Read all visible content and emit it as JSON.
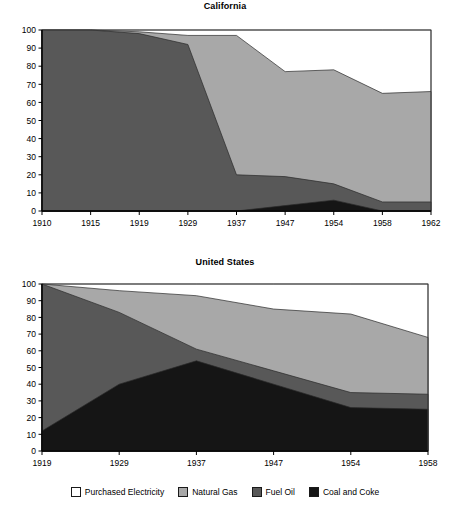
{
  "figure": {
    "legend": [
      {
        "label": "Purchased Electricity",
        "color": "#ffffff",
        "key": "purchased_electricity"
      },
      {
        "label": "Natural Gas",
        "color": "#a8a8a8",
        "key": "natural_gas"
      },
      {
        "label": "Fuel Oil",
        "color": "#585858",
        "key": "fuel_oil"
      },
      {
        "label": "Coal and Coke",
        "color": "#151515",
        "key": "coal_and_coke"
      }
    ]
  },
  "chart_data": [
    {
      "type": "area",
      "stacked": true,
      "title": "California",
      "xlabel": "",
      "ylabel": "",
      "ylim": [
        0,
        100
      ],
      "yticks": [
        0,
        10,
        20,
        30,
        40,
        50,
        60,
        70,
        80,
        90,
        100
      ],
      "grid": false,
      "legend_position": "bottom",
      "categories": [
        "1910",
        "1915",
        "1919",
        "1929",
        "1937",
        "1947",
        "1954",
        "1958",
        "1962"
      ],
      "series": [
        {
          "name": "Coal and Coke",
          "color": "#151515",
          "values": [
            0,
            0,
            0,
            0,
            0,
            3,
            6,
            0,
            0
          ]
        },
        {
          "name": "Fuel Oil",
          "color": "#585858",
          "values": [
            100,
            100,
            98,
            92,
            20,
            16,
            9,
            5,
            5
          ]
        },
        {
          "name": "Natural Gas",
          "color": "#a8a8a8",
          "values": [
            0,
            0,
            1,
            5,
            77,
            58,
            63,
            60,
            61
          ]
        },
        {
          "name": "Purchased Electricity",
          "color": "#ffffff",
          "values": [
            0,
            0,
            1,
            3,
            3,
            23,
            22,
            35,
            34
          ]
        }
      ],
      "cumulative_tops": {
        "coal_and_coke": [
          0,
          0,
          0,
          0,
          0,
          3,
          6,
          0,
          0
        ],
        "fuel_oil": [
          100,
          100,
          98,
          92,
          20,
          19,
          15,
          5,
          5
        ],
        "natural_gas": [
          100,
          100,
          99,
          97,
          97,
          77,
          78,
          65,
          66
        ],
        "purchased_electricity": [
          100,
          100,
          100,
          100,
          100,
          100,
          100,
          100,
          100
        ]
      }
    },
    {
      "type": "area",
      "stacked": true,
      "title": "United States",
      "xlabel": "",
      "ylabel": "",
      "ylim": [
        0,
        100
      ],
      "yticks": [
        0,
        10,
        20,
        30,
        40,
        50,
        60,
        70,
        80,
        90,
        100
      ],
      "grid": false,
      "legend_position": "bottom",
      "categories": [
        "1919",
        "1929",
        "1937",
        "1947",
        "1954",
        "1958"
      ],
      "series": [
        {
          "name": "Coal and Coke",
          "color": "#151515",
          "values": [
            12,
            40,
            54,
            40,
            26,
            25
          ]
        },
        {
          "name": "Fuel Oil",
          "color": "#585858",
          "values": [
            88,
            43,
            7,
            8,
            9,
            9
          ]
        },
        {
          "name": "Natural Gas",
          "color": "#a8a8a8",
          "values": [
            0,
            13,
            32,
            37,
            47,
            34
          ]
        },
        {
          "name": "Purchased Electricity",
          "color": "#ffffff",
          "values": [
            0,
            4,
            7,
            15,
            18,
            32
          ]
        }
      ],
      "cumulative_tops": {
        "coal_and_coke": [
          12,
          40,
          54,
          40,
          26,
          25
        ],
        "fuel_oil": [
          100,
          83,
          61,
          48,
          35,
          34
        ],
        "natural_gas": [
          100,
          96,
          93,
          85,
          82,
          68
        ],
        "purchased_electricity": [
          100,
          100,
          100,
          100,
          100,
          100
        ]
      }
    }
  ]
}
